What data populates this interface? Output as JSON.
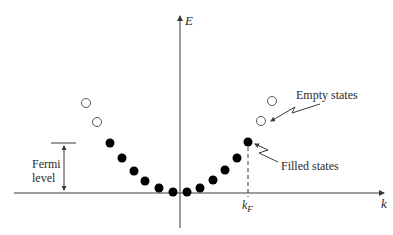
{
  "axes": {
    "y_label": "E",
    "x_label": "k",
    "kf_label": "k",
    "kf_subscript": "F"
  },
  "annotations": {
    "fermi_line1": "Fermi",
    "fermi_line2": "level",
    "empty_states": "Empty states",
    "filled_states": "Filled states"
  },
  "points": {
    "empty": [
      [
        86,
        103
      ],
      [
        97,
        122
      ],
      [
        261,
        121
      ],
      [
        272,
        101
      ]
    ],
    "filled": [
      [
        110,
        143
      ],
      [
        122,
        158
      ],
      [
        134,
        171
      ],
      [
        145,
        181
      ],
      [
        159,
        188
      ],
      [
        173,
        192
      ],
      [
        187,
        192
      ],
      [
        200,
        188
      ],
      [
        213,
        180
      ],
      [
        225,
        170
      ],
      [
        237,
        158
      ],
      [
        248,
        142
      ]
    ]
  },
  "colors": {
    "line": "#3a3a3a",
    "dot": "#000000"
  }
}
